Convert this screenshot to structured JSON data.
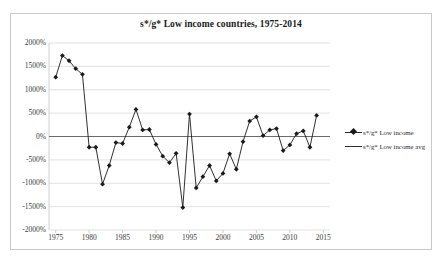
{
  "chart_data": {
    "type": "line",
    "title": "s*/g* Low income countries, 1975-2014",
    "xlabel": "",
    "ylabel": "",
    "xlim": [
      1974,
      2016
    ],
    "ylim": [
      -2000,
      2000
    ],
    "grid": true,
    "legend_position": "right",
    "x_ticks": [
      "1975",
      "1980",
      "1985",
      "1990",
      "1995",
      "2000",
      "2005",
      "2010",
      "2015"
    ],
    "x_tick_values": [
      1975,
      1980,
      1985,
      1990,
      1995,
      2000,
      2005,
      2010,
      2015
    ],
    "y_ticks": [
      "2000%",
      "1500%",
      "1000%",
      "500%",
      "0%",
      "-500%",
      "-1000%",
      "-1500%",
      "-2000%"
    ],
    "y_tick_values": [
      2000,
      1500,
      1000,
      500,
      0,
      -500,
      -1000,
      -1500,
      -2000
    ],
    "series": [
      {
        "name": "s*/g* Low income",
        "marker": "diamond",
        "color": "#1a1a1a",
        "x": [
          1975,
          1976,
          1977,
          1978,
          1979,
          1980,
          1981,
          1982,
          1983,
          1984,
          1985,
          1986,
          1987,
          1988,
          1989,
          1990,
          1991,
          1992,
          1993,
          1994,
          1995,
          1996,
          1997,
          1998,
          1999,
          2000,
          2001,
          2002,
          2003,
          2004,
          2005,
          2006,
          2007,
          2008,
          2009,
          2010,
          2011,
          2012,
          2013,
          2014
        ],
        "values": [
          1270,
          1730,
          1620,
          1450,
          1330,
          -230,
          -230,
          -1020,
          -620,
          -130,
          -150,
          200,
          580,
          140,
          150,
          -170,
          -420,
          -560,
          -360,
          -1520,
          480,
          -1100,
          -860,
          -620,
          -950,
          -790,
          -370,
          -700,
          -110,
          330,
          420,
          20,
          140,
          170,
          -300,
          -180,
          60,
          120,
          -230,
          450
        ]
      },
      {
        "name": "s*/g* Low income avg",
        "marker": "none",
        "color": "#6b6b6b",
        "constant_value": 0
      }
    ]
  },
  "legend": {
    "items": [
      {
        "label": "s*/g* Low income",
        "marker": "diamond-line"
      },
      {
        "label": "s*/g* Low income avg",
        "marker": "line"
      }
    ]
  }
}
